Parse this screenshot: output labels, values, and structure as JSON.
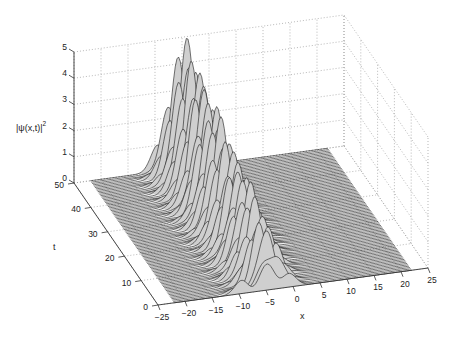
{
  "chart_data": {
    "type": "surface",
    "title": "",
    "xlabel": "x",
    "ylabel": "t",
    "zlabel": "|ψ(x,t)|²",
    "zlabel_base": "|ψ(x,t)|",
    "zlabel_sup": "2",
    "xlim": [
      -25,
      25
    ],
    "ylim": [
      0,
      50
    ],
    "zlim": [
      0,
      5
    ],
    "xticks": [
      -25,
      -20,
      -15,
      -10,
      -5,
      0,
      5,
      10,
      15,
      20,
      25
    ],
    "yticks": [
      0,
      10,
      20,
      30,
      40,
      50
    ],
    "zticks": [
      0,
      1,
      2,
      3,
      4,
      5
    ],
    "grid": true,
    "colormap": "grayscale mesh",
    "surface_extent": {
      "x": [
        -22,
        22
      ],
      "t": [
        0,
        50
      ]
    },
    "features": {
      "description": "Localized oscillating hump centered near x≈-5, with ~17 sharp peaks along t, peak amplitude ~4.3 at large t, background ≈0",
      "peak_center_x": -5,
      "peak_width_x": 4,
      "peak_count": 17,
      "max_height": 4.3,
      "min_height_band": 1.0
    }
  },
  "projection": {
    "origin": [
      158,
      305
    ],
    "ux": [
      5.4,
      -0.74
    ],
    "ut": [
      -1.68,
      -2.44
    ],
    "uz": [
      0,
      -26.2
    ]
  },
  "colors": {
    "axis": "#333333",
    "grid": "#9a9a9a",
    "mesh_dark": "#1a1a1a",
    "mesh_light": "#cfcfcf"
  }
}
